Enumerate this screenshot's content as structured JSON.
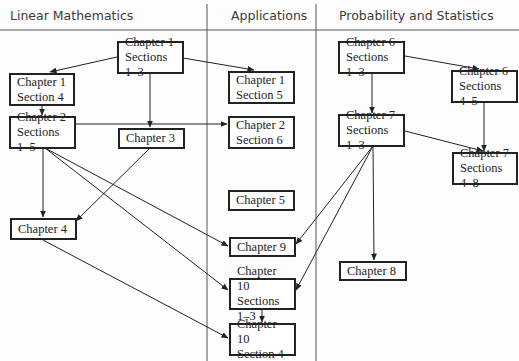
{
  "headers": {
    "linear": "Linear Mathematics",
    "applications": "Applications",
    "probability": "Probability and Statistics"
  },
  "nodes": {
    "ch1s13": {
      "line1": "Chapter 1",
      "line2": "Sections 1–3"
    },
    "ch1s4": {
      "line1": "Chapter 1",
      "line2": "Section 4"
    },
    "ch1s5": {
      "line1": "Chapter 1",
      "line2": "Section 5"
    },
    "ch2s15": {
      "line1": "Chapter 2",
      "line2": "Sections 1–5"
    },
    "ch2s6": {
      "line1": "Chapter 2",
      "line2": "Section 6"
    },
    "ch3": {
      "line1": "Chapter 3"
    },
    "ch4": {
      "line1": "Chapter 4"
    },
    "ch5": {
      "line1": "Chapter 5"
    },
    "ch9": {
      "line1": "Chapter 9"
    },
    "ch10s13": {
      "line1": "Chapter 10",
      "line2": "Sections 1–3"
    },
    "ch10s4": {
      "line1": "Chapter 10",
      "line2": "Section 4"
    },
    "ch6s13": {
      "line1": "Chapter 6",
      "line2": "Sections 1–3"
    },
    "ch6s45": {
      "line1": "Chapter 6",
      "line2": "Sections 4–5"
    },
    "ch7s13": {
      "line1": "Chapter 7",
      "line2": "Sections 1–3"
    },
    "ch7s48": {
      "line1": "Chapter 7",
      "line2": "Sections 4–8"
    },
    "ch8": {
      "line1": "Chapter 8"
    }
  },
  "edges": [
    [
      "ch1s13",
      "ch1s4"
    ],
    [
      "ch1s13",
      "ch1s5"
    ],
    [
      "ch1s13",
      "ch3"
    ],
    [
      "ch1s4",
      "ch2s15"
    ],
    [
      "ch2s15",
      "ch2s6"
    ],
    [
      "ch2s15",
      "ch4"
    ],
    [
      "ch2s15",
      "ch9"
    ],
    [
      "ch2s15",
      "ch10s13"
    ],
    [
      "ch3",
      "ch4"
    ],
    [
      "ch4",
      "ch10s4"
    ],
    [
      "ch10s13",
      "ch10s4"
    ],
    [
      "ch6s13",
      "ch6s45"
    ],
    [
      "ch6s13",
      "ch7s13"
    ],
    [
      "ch6s45",
      "ch7s48"
    ],
    [
      "ch7s13",
      "ch7s48"
    ],
    [
      "ch7s13",
      "ch9"
    ],
    [
      "ch7s13",
      "ch10s13"
    ],
    [
      "ch7s13",
      "ch8"
    ]
  ]
}
